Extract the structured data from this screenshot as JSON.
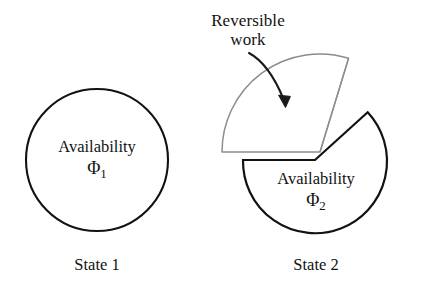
{
  "figure": {
    "background_color": "#ffffff",
    "stroke_color": "#121212",
    "wedge_stroke_color": "#8c8c8c"
  },
  "annotation": {
    "line1": "Reversible",
    "line2": "work",
    "arrow_icon": "curved-arrow-icon"
  },
  "state1": {
    "availability_label": "Availability",
    "symbol": "Φ",
    "subscript": "1",
    "caption": "State 1"
  },
  "state2": {
    "availability_label": "Availability",
    "symbol": "Φ",
    "subscript": "2",
    "caption": "State 2"
  }
}
